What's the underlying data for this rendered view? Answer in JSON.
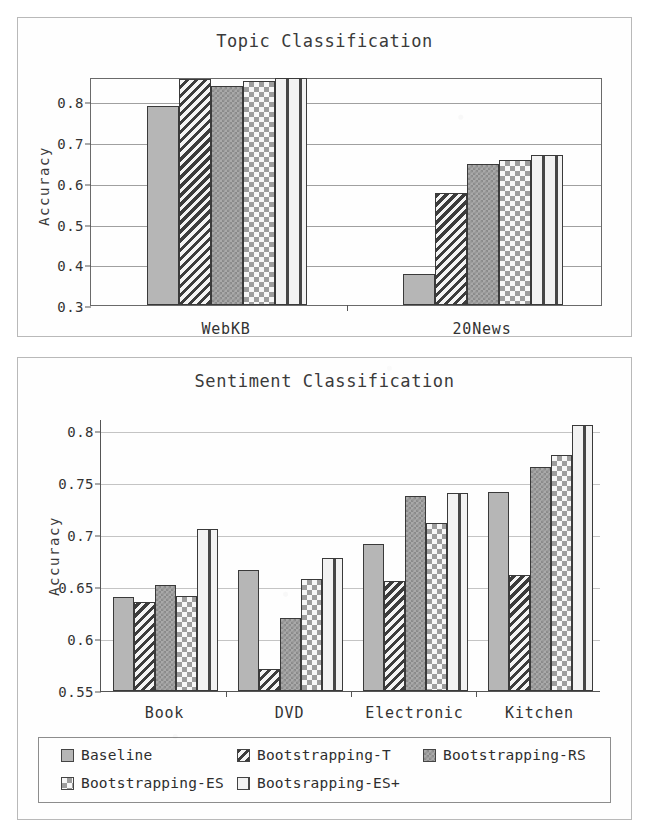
{
  "figure": {
    "ylabel": "Accuracy"
  },
  "legend": {
    "rows": [
      [
        {
          "label": "Baseline",
          "pattern": 0,
          "left": 22,
          "icon": "legend-swatch-solid-gray"
        },
        {
          "label": "Bootstrapping-T",
          "pattern": 1,
          "left": 198,
          "icon": "legend-swatch-diagonal-stripe"
        },
        {
          "label": "Bootstrapping-RS",
          "pattern": 2,
          "left": 384,
          "icon": "legend-swatch-fine-checker"
        }
      ],
      [
        {
          "label": "Bootstrapping-ES",
          "pattern": 3,
          "left": 22,
          "icon": "legend-swatch-light-checker"
        },
        {
          "label": "Bootsrapping-ES+",
          "pattern": 4,
          "left": 198,
          "icon": "legend-swatch-dark-dash"
        }
      ]
    ]
  },
  "chart_data": [
    {
      "id": "topic",
      "type": "bar",
      "title": "Topic Classification",
      "xlabel": "",
      "ylabel": "Accuracy",
      "ylim": [
        0.3,
        0.86
      ],
      "yticks": [
        0.3,
        0.4,
        0.5,
        0.6,
        0.7,
        0.8
      ],
      "yticklabels": [
        "0.3",
        "0.4",
        "0.5",
        "0.6",
        "0.7",
        "0.8"
      ],
      "grid": true,
      "framed": true,
      "legend_position": "below-figure",
      "categories": [
        "WebKB",
        "20News"
      ],
      "series": [
        {
          "name": "Baseline",
          "pattern": 0,
          "values": [
            0.79,
            0.375
          ]
        },
        {
          "name": "Bootstrapping-T",
          "pattern": 1,
          "values": [
            0.855,
            0.576
          ]
        },
        {
          "name": "Bootstrapping-RS",
          "pattern": 2,
          "values": [
            0.838,
            0.647
          ]
        },
        {
          "name": "Bootstrapping-ES",
          "pattern": 3,
          "values": [
            0.851,
            0.655
          ]
        },
        {
          "name": "Bootsrapping-ES+",
          "pattern": 4,
          "values": [
            0.858,
            0.668
          ]
        }
      ]
    },
    {
      "id": "sentiment",
      "type": "bar",
      "title": "Sentiment Classification",
      "xlabel": "",
      "ylabel": "Accuracy",
      "ylim": [
        0.55,
        0.812
      ],
      "yticks": [
        0.55,
        0.6,
        0.65,
        0.7,
        0.75,
        0.8
      ],
      "yticklabels": [
        "0.55",
        "0.6",
        "0.65",
        "0.7",
        "0.75",
        "0.8"
      ],
      "grid": true,
      "framed": false,
      "legend_position": "below-figure",
      "categories": [
        "Book",
        "DVD",
        "Electronic",
        "Kitchen"
      ],
      "series": [
        {
          "name": "Baseline",
          "pattern": 0,
          "values": [
            0.641,
            0.667,
            0.692,
            0.742
          ]
        },
        {
          "name": "Bootstrapping-T",
          "pattern": 1,
          "values": [
            0.636,
            0.571,
            0.656,
            0.662
          ]
        },
        {
          "name": "Bootstrapping-RS",
          "pattern": 2,
          "values": [
            0.652,
            0.62,
            0.738,
            0.766
          ]
        },
        {
          "name": "Bootstrapping-ES",
          "pattern": 3,
          "values": [
            0.642,
            0.658,
            0.712,
            0.777
          ]
        },
        {
          "name": "Bootsrapping-ES+",
          "pattern": 4,
          "values": [
            0.706,
            0.678,
            0.741,
            0.806
          ]
        }
      ]
    }
  ]
}
